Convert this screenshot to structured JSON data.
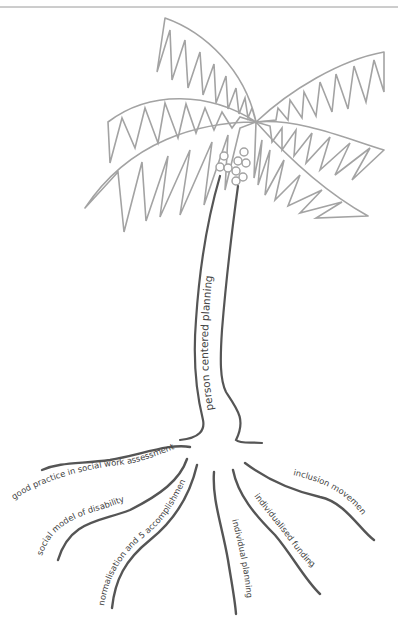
{
  "diagram": {
    "type": "metaphor-tree",
    "trunk": {
      "label": "person centered planning"
    },
    "roots": [
      {
        "id": "good-practice",
        "label": "good practice in social work assessment"
      },
      {
        "id": "social-model",
        "label": "social model of disability"
      },
      {
        "id": "normalisation",
        "label": "normalisation and 5 accomplishments"
      },
      {
        "id": "individual-planning",
        "label": "individual planning"
      },
      {
        "id": "individualised-funding",
        "label": "individualised funding"
      },
      {
        "id": "inclusion-movement",
        "label": "inclusion movement"
      }
    ],
    "colors": {
      "leaves": "#a3a3a3",
      "trunk": "#555555",
      "roots": "#555555",
      "text": "#444444"
    }
  }
}
